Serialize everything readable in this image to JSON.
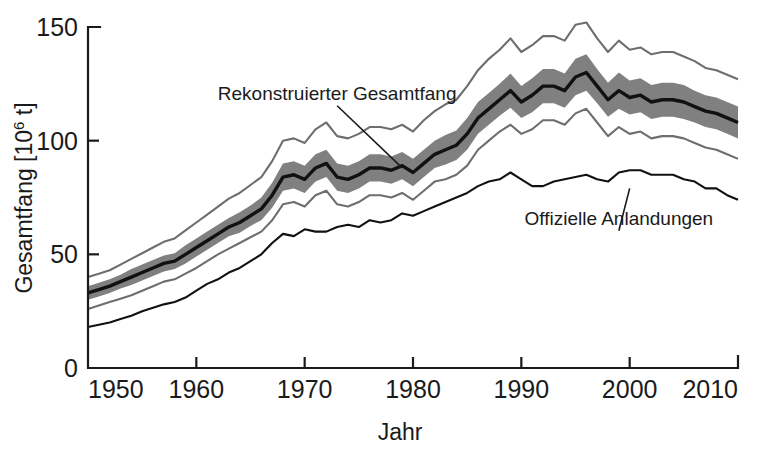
{
  "chart_data": {
    "type": "line",
    "title": "",
    "xlabel": "Jahr",
    "ylabel": "Gesamtfang [10⁶ t]",
    "ylabel_base": "Gesamtfang [10",
    "ylabel_exponent": "6",
    "ylabel_tail": " t]",
    "xlim": [
      1950,
      2010
    ],
    "ylim": [
      0,
      150
    ],
    "grid": false,
    "legend_position": "inline-annotations",
    "xticks": [
      1950,
      1960,
      1970,
      1980,
      1990,
      2000,
      2010
    ],
    "xtick_labels": [
      "1950",
      "1960",
      "1970",
      "1980",
      "1990",
      "2000",
      "2010"
    ],
    "yticks": [
      0,
      50,
      100,
      150
    ],
    "ytick_labels": [
      "0",
      "50",
      "100",
      "150"
    ],
    "annotations": [
      {
        "text": "Rekonstruierter Gesamtfang",
        "x": 1973,
        "y": 118,
        "points_to_x": 1979,
        "points_to_y": 88
      },
      {
        "text": "Offizielle Anlandungen",
        "x": 1999,
        "y": 63,
        "points_to_x": 2000,
        "points_to_y": 79
      }
    ],
    "x": [
      1950,
      1951,
      1952,
      1953,
      1954,
      1955,
      1956,
      1957,
      1958,
      1959,
      1960,
      1961,
      1962,
      1963,
      1964,
      1965,
      1966,
      1967,
      1968,
      1969,
      1970,
      1971,
      1972,
      1973,
      1974,
      1975,
      1976,
      1977,
      1978,
      1979,
      1980,
      1981,
      1982,
      1983,
      1984,
      1985,
      1986,
      1987,
      1988,
      1989,
      1990,
      1991,
      1992,
      1993,
      1994,
      1995,
      1996,
      1997,
      1998,
      1999,
      2000,
      2001,
      2002,
      2003,
      2004,
      2005,
      2006,
      2007,
      2008,
      2009,
      2010
    ],
    "series": [
      {
        "name": "Rekonstruierter Gesamtfang",
        "style": "thick-black-line",
        "color": "#111111",
        "values": [
          33,
          34.5,
          36,
          38,
          40,
          42,
          44,
          46,
          47,
          50,
          53,
          56,
          59,
          62,
          64,
          67,
          70,
          76,
          84,
          85,
          83,
          88,
          90,
          84,
          83,
          85,
          88,
          88,
          87,
          89,
          86,
          90,
          94,
          96,
          98,
          103,
          110,
          114,
          118,
          122,
          117,
          120,
          124,
          124,
          122,
          128,
          130,
          124,
          118,
          122,
          119,
          120,
          117,
          118,
          118,
          117,
          115,
          113,
          112,
          110,
          108
        ]
      },
      {
        "name": "Unsicherheitsband oben",
        "style": "band-upper",
        "color": "#808080",
        "values": [
          36,
          37.5,
          39,
          41,
          43.5,
          45.5,
          47.5,
          49.5,
          50.5,
          54,
          57,
          60,
          63,
          66,
          68.5,
          71.5,
          75,
          81.5,
          90,
          91,
          89,
          94,
          96,
          90,
          89,
          91,
          94,
          94,
          93,
          95,
          92,
          96,
          100,
          102.5,
          104.5,
          110,
          117,
          121,
          125,
          129.5,
          124,
          127.5,
          131.5,
          131.5,
          129.5,
          136,
          138,
          131.5,
          125.5,
          130,
          126.5,
          127.5,
          124.5,
          125.5,
          125.5,
          124.5,
          122,
          120,
          119,
          117,
          115
        ]
      },
      {
        "name": "Unsicherheitsband unten",
        "style": "band-lower",
        "color": "#808080",
        "values": [
          30,
          31.5,
          33,
          35,
          36.5,
          38.5,
          40.5,
          42.5,
          43.5,
          46,
          49,
          52,
          55,
          58,
          59.5,
          62.5,
          65,
          70.5,
          78,
          79,
          77,
          82,
          84,
          78,
          77,
          79,
          82,
          82,
          81,
          83,
          80,
          84,
          88,
          89.5,
          91.5,
          96,
          103,
          107,
          111,
          114.5,
          110,
          112.5,
          116.5,
          116.5,
          114.5,
          120,
          122,
          116.5,
          110.5,
          114,
          111.5,
          112.5,
          109.5,
          110.5,
          110.5,
          109.5,
          108,
          106,
          105,
          103,
          101
        ]
      },
      {
        "name": "Obere Konfidenzgrenze",
        "style": "thin-gray-line",
        "color": "#6e6e6e",
        "values": [
          40,
          41.5,
          43,
          45.5,
          48,
          50.5,
          53,
          55.5,
          57,
          60.5,
          64,
          67.5,
          71,
          74.5,
          77,
          80.5,
          84,
          91,
          100,
          101,
          99,
          105,
          108,
          102,
          101,
          103,
          106,
          106,
          105,
          107,
          104,
          109,
          113,
          116,
          118,
          124,
          131,
          136,
          140,
          145,
          139,
          142,
          146,
          146,
          144,
          151,
          152,
          145,
          139,
          144,
          140,
          141,
          138,
          139,
          139,
          137,
          135,
          132,
          131,
          129,
          127
        ]
      },
      {
        "name": "Untere Konfidenzgrenze",
        "style": "thin-gray-line",
        "color": "#6e6e6e",
        "values": [
          26,
          27.5,
          29,
          30.5,
          32,
          34,
          36,
          38,
          39,
          41.5,
          44,
          47,
          50,
          52.5,
          55,
          57.5,
          60,
          65,
          72,
          73,
          71,
          76,
          78,
          72,
          71,
          73,
          76,
          76,
          75,
          77,
          74,
          78,
          82,
          83,
          85,
          89,
          96,
          100,
          104,
          107,
          103,
          105,
          109,
          109,
          107,
          112,
          114,
          108,
          102,
          106,
          103,
          104,
          101,
          102,
          102,
          101,
          99,
          97,
          96,
          94,
          92
        ]
      },
      {
        "name": "Offizielle Anlandungen",
        "style": "thin-black-line",
        "color": "#111111",
        "values": [
          18,
          19,
          20,
          21.5,
          23,
          25,
          26.5,
          28,
          29,
          31,
          34,
          37,
          39,
          42,
          44,
          47,
          50,
          55,
          59,
          58,
          61,
          60,
          60,
          62,
          63,
          62,
          65,
          64,
          65,
          68,
          67,
          69,
          71,
          73,
          75,
          77,
          80,
          82,
          83,
          86,
          83,
          80,
          80,
          82,
          83,
          84,
          85,
          83,
          82,
          86,
          87,
          87,
          85,
          85,
          85,
          83,
          82,
          79,
          79,
          76,
          74
        ]
      }
    ]
  }
}
